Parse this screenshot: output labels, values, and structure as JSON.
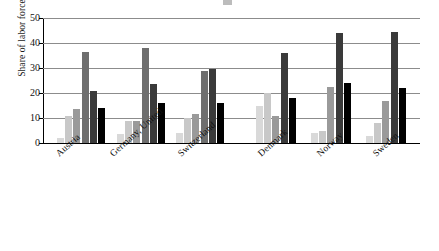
{
  "chart_data": {
    "type": "bar",
    "title": "",
    "xlabel": "",
    "ylabel": "Share of labor force",
    "ylim": [
      0,
      50
    ],
    "yticks": [
      0,
      10,
      20,
      30,
      40,
      50
    ],
    "grid": true,
    "legend": "none",
    "categories": [
      "Austria",
      "Germany, United",
      "Switzerland",
      "Denmark",
      "Norway",
      "Sweden"
    ],
    "group_gap_after": "Switzerland",
    "series": [
      {
        "name": "series-1",
        "color": "#d9d9d9",
        "values": [
          2.0,
          3.5,
          4.0,
          15.0,
          4.0,
          3.0
        ]
      },
      {
        "name": "series-2",
        "color": "#c4c4c4",
        "values": [
          11.0,
          9.0,
          10.0,
          20.0,
          5.0,
          8.0
        ]
      },
      {
        "name": "series-3",
        "color": "#9a9a9a",
        "values": [
          13.5,
          9.0,
          11.5,
          11.0,
          22.5,
          17.0
        ]
      },
      {
        "name": "series-4",
        "color": "#6e6e6e",
        "values": [
          36.5,
          38.0,
          29.0,
          null,
          null,
          null
        ]
      },
      {
        "name": "series-5",
        "color": "#3a3a3a",
        "values": [
          21.0,
          23.5,
          29.5,
          36.0,
          44.0,
          44.5
        ]
      },
      {
        "name": "series-6",
        "color": "#000000",
        "values": [
          14.0,
          16.0,
          16.0,
          18.0,
          24.0,
          22.0
        ]
      }
    ],
    "groups": [
      {
        "label": "Austria",
        "bars": [
          {
            "value": 2.0,
            "color": "#d9d9d9"
          },
          {
            "value": 11.0,
            "color": "#c8c8c8"
          },
          {
            "value": 13.5,
            "color": "#9a9a9a"
          },
          {
            "value": 36.5,
            "color": "#6e6e6e"
          },
          {
            "value": 21.0,
            "color": "#3a3a3a"
          },
          {
            "value": 14.0,
            "color": "#000000"
          }
        ]
      },
      {
        "label": "Germany, United",
        "bars": [
          {
            "value": 3.5,
            "color": "#d9d9d9"
          },
          {
            "value": 9.0,
            "color": "#c8c8c8"
          },
          {
            "value": 9.0,
            "color": "#9a9a9a"
          },
          {
            "value": 38.0,
            "color": "#6e6e6e"
          },
          {
            "value": 23.5,
            "color": "#3a3a3a"
          },
          {
            "value": 16.0,
            "color": "#000000"
          }
        ]
      },
      {
        "label": "Switzerland",
        "bars": [
          {
            "value": 4.0,
            "color": "#d9d9d9"
          },
          {
            "value": 10.0,
            "color": "#c8c8c8"
          },
          {
            "value": 11.5,
            "color": "#9a9a9a"
          },
          {
            "value": 29.0,
            "color": "#6e6e6e"
          },
          {
            "value": 29.5,
            "color": "#3a3a3a"
          },
          {
            "value": 16.0,
            "color": "#000000"
          }
        ]
      },
      {
        "label": "Denmark",
        "bars": [
          {
            "value": 15.0,
            "color": "#d9d9d9"
          },
          {
            "value": 20.0,
            "color": "#c8c8c8"
          },
          {
            "value": 11.0,
            "color": "#9a9a9a"
          },
          {
            "value": 36.0,
            "color": "#3a3a3a"
          },
          {
            "value": 18.0,
            "color": "#000000"
          }
        ]
      },
      {
        "label": "Norway",
        "bars": [
          {
            "value": 4.0,
            "color": "#d9d9d9"
          },
          {
            "value": 5.0,
            "color": "#c8c8c8"
          },
          {
            "value": 22.5,
            "color": "#9a9a9a"
          },
          {
            "value": 44.0,
            "color": "#3a3a3a"
          },
          {
            "value": 24.0,
            "color": "#000000"
          }
        ]
      },
      {
        "label": "Sweden",
        "bars": [
          {
            "value": 3.0,
            "color": "#d9d9d9"
          },
          {
            "value": 8.0,
            "color": "#c8c8c8"
          },
          {
            "value": 17.0,
            "color": "#9a9a9a"
          },
          {
            "value": 44.5,
            "color": "#3a3a3a"
          },
          {
            "value": 22.0,
            "color": "#000000"
          }
        ]
      }
    ]
  },
  "axis": {
    "y_title": "Share of labor force",
    "ticks": [
      "0",
      "10",
      "20",
      "30",
      "40",
      "50"
    ]
  }
}
